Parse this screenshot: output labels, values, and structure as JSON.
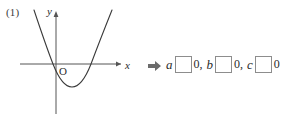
{
  "problem": {
    "number": "(1)"
  },
  "graph": {
    "axis_labels": {
      "x": "x",
      "y": "y",
      "origin": "O"
    },
    "curve": {
      "shape": "parabola",
      "opens": "up",
      "vertex_below_x_axis": true,
      "vertex_right_of_y_axis": true,
      "x_intercepts": 2,
      "stroke_color": "#3a3a3a"
    },
    "axis_color": "#555555"
  },
  "answer": {
    "arrow_icon": "rightwards-arrow-icon",
    "terms": [
      {
        "variable": "a",
        "box_value": "",
        "comparison_value": "0",
        "separator": ","
      },
      {
        "variable": "b",
        "box_value": "",
        "comparison_value": "0",
        "separator": ","
      },
      {
        "variable": "c",
        "box_value": "",
        "comparison_value": "0",
        "separator": ""
      }
    ],
    "box_border_color": "#8d8d8d"
  }
}
